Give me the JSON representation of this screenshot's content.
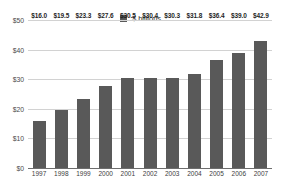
{
  "chart_data": {
    "type": "bar",
    "title": "",
    "subtitle": "",
    "xlabel": "",
    "ylabel": "",
    "categories": [
      "1997",
      "1998",
      "1999",
      "2000",
      "2001",
      "2002",
      "2003",
      "2004",
      "2005",
      "2006",
      "2007"
    ],
    "values": [
      16.0,
      19.5,
      23.3,
      27.6,
      30.5,
      30.4,
      30.3,
      31.8,
      36.4,
      39.0,
      42.9
    ],
    "point_labels": [
      "$16.0",
      "$19.5",
      "$23.3",
      "$27.6",
      "$30.5",
      "$30.4",
      "$30.3",
      "$31.8",
      "$36.4",
      "$39.0",
      "$42.9"
    ],
    "series": [
      {
        "name": "$ billions",
        "color": "#595959",
        "values": [
          16.0,
          19.5,
          23.3,
          27.6,
          30.5,
          30.4,
          30.3,
          31.8,
          36.4,
          39.0,
          42.9
        ]
      }
    ],
    "ylim": [
      0,
      50
    ],
    "ytick_values": [
      0,
      10,
      20,
      30,
      40,
      50
    ],
    "ytick_labels": [
      "$0",
      "$10",
      "$20",
      "$30",
      "$40",
      "$50"
    ],
    "grid": true,
    "grid_color": "#d2d2d2",
    "legend": {
      "position": "top-center",
      "entries": [
        {
          "label": "$ billions",
          "color": "#595959",
          "marker": "square-swatch"
        }
      ]
    },
    "background_color": "#ffffff",
    "bar_color": "#595959",
    "axis_color": "#6e6e6e"
  }
}
